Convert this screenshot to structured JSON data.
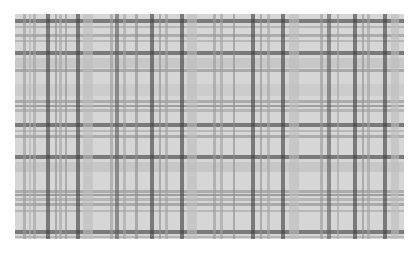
{
  "image": {
    "subject": "grayscale plaid tartan fabric pattern",
    "colors": {
      "base": "#d6d6d6",
      "light": "#e6e6e6",
      "mid": "#a8a8a8",
      "dark": "#3c3c3c"
    },
    "vertical_bands": [
      {
        "x": 8,
        "w": 3,
        "c": "#9a9a9a"
      },
      {
        "x": 14,
        "w": 2,
        "c": "#b0b0b0"
      },
      {
        "x": 18,
        "w": 3,
        "c": "#a0a0a0"
      },
      {
        "x": 31,
        "w": 4,
        "c": "#3c3c3c"
      },
      {
        "x": 40,
        "w": 2,
        "c": "#8c8c8c"
      },
      {
        "x": 44,
        "w": 3,
        "c": "#a4a4a4"
      },
      {
        "x": 50,
        "w": 2,
        "c": "#909090"
      },
      {
        "x": 61,
        "w": 4,
        "c": "#3c3c3c"
      },
      {
        "x": 68,
        "w": 10,
        "c": "#bcbcbc"
      },
      {
        "x": 95,
        "w": 3,
        "c": "#9a9a9a"
      },
      {
        "x": 100,
        "w": 4,
        "c": "#5a5a5a"
      },
      {
        "x": 108,
        "w": 3,
        "c": "#a4a4a4"
      },
      {
        "x": 120,
        "w": 3,
        "c": "#8c8c8c"
      },
      {
        "x": 135,
        "w": 4,
        "c": "#3c3c3c"
      },
      {
        "x": 144,
        "w": 2,
        "c": "#909090"
      },
      {
        "x": 150,
        "w": 3,
        "c": "#a0a0a0"
      },
      {
        "x": 165,
        "w": 4,
        "c": "#3c3c3c"
      },
      {
        "x": 172,
        "w": 10,
        "c": "#bcbcbc"
      },
      {
        "x": 198,
        "w": 3,
        "c": "#9a9a9a"
      },
      {
        "x": 205,
        "w": 3,
        "c": "#a0a0a0"
      },
      {
        "x": 218,
        "w": 2,
        "c": "#8c8c8c"
      },
      {
        "x": 236,
        "w": 4,
        "c": "#3c3c3c"
      },
      {
        "x": 245,
        "w": 2,
        "c": "#909090"
      },
      {
        "x": 252,
        "w": 3,
        "c": "#a4a4a4"
      },
      {
        "x": 266,
        "w": 4,
        "c": "#3c3c3c"
      },
      {
        "x": 274,
        "w": 10,
        "c": "#bcbcbc"
      },
      {
        "x": 305,
        "w": 3,
        "c": "#9a9a9a"
      },
      {
        "x": 312,
        "w": 4,
        "c": "#5a5a5a"
      },
      {
        "x": 322,
        "w": 2,
        "c": "#a4a4a4"
      },
      {
        "x": 338,
        "w": 4,
        "c": "#3c3c3c"
      },
      {
        "x": 347,
        "w": 2,
        "c": "#909090"
      },
      {
        "x": 352,
        "w": 3,
        "c": "#a0a0a0"
      },
      {
        "x": 368,
        "w": 4,
        "c": "#3c3c3c"
      },
      {
        "x": 376,
        "w": 8,
        "c": "#bcbcbc"
      }
    ],
    "horizontal_bands": [
      {
        "y": 5,
        "h": 4,
        "c": "#3c3c3c"
      },
      {
        "y": 12,
        "h": 2,
        "c": "#a0a0a0"
      },
      {
        "y": 20,
        "h": 3,
        "c": "#909090"
      },
      {
        "y": 26,
        "h": 2,
        "c": "#a4a4a4"
      },
      {
        "y": 37,
        "h": 4,
        "c": "#3c3c3c"
      },
      {
        "y": 44,
        "h": 10,
        "c": "#bcbcbc"
      },
      {
        "y": 55,
        "h": 3,
        "c": "#8c8c8c"
      },
      {
        "y": 70,
        "h": 12,
        "c": "#c4c4c4"
      },
      {
        "y": 86,
        "h": 3,
        "c": "#909090"
      },
      {
        "y": 91,
        "h": 2,
        "c": "#7a7a7a"
      },
      {
        "y": 95,
        "h": 3,
        "c": "#a0a0a0"
      },
      {
        "y": 109,
        "h": 4,
        "c": "#3c3c3c"
      },
      {
        "y": 116,
        "h": 2,
        "c": "#a4a4a4"
      },
      {
        "y": 121,
        "h": 3,
        "c": "#909090"
      },
      {
        "y": 141,
        "h": 4,
        "c": "#3c3c3c"
      },
      {
        "y": 148,
        "h": 10,
        "c": "#bcbcbc"
      },
      {
        "y": 176,
        "h": 3,
        "c": "#909090"
      },
      {
        "y": 180,
        "h": 2,
        "c": "#7a7a7a"
      },
      {
        "y": 184,
        "h": 3,
        "c": "#a0a0a0"
      },
      {
        "y": 189,
        "h": 3,
        "c": "#8c8c8c"
      },
      {
        "y": 196,
        "h": 2,
        "c": "#a4a4a4"
      },
      {
        "y": 216,
        "h": 4,
        "c": "#3c3c3c"
      },
      {
        "y": 222,
        "h": 2,
        "c": "#a0a0a0"
      }
    ]
  }
}
